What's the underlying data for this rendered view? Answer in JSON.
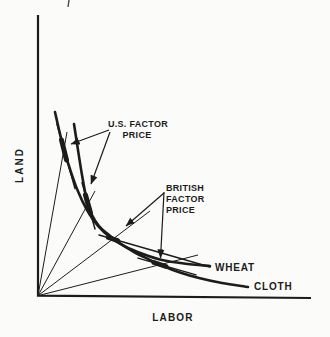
{
  "page": {
    "background": "#fbfbf9",
    "ink": "#1c1c1c"
  },
  "chart_data": {
    "type": "line",
    "title": "",
    "xlabel": "LABOR",
    "ylabel": "LAND",
    "axis_numeric": false,
    "legend": "none",
    "grid": false,
    "axes_geometry": {
      "origin": [
        38,
        295.7
      ],
      "x_end": [
        311,
        298
      ],
      "y_top": [
        38,
        15
      ],
      "stroke_width": 2.2
    },
    "page_artifact_tick": {
      "from": [
        69,
        0
      ],
      "to": [
        68,
        7
      ]
    },
    "curves": [
      {
        "name": "wheat-isoquant",
        "label": "WHEAT",
        "width": 2.6,
        "points": [
          [
            55,
            112
          ],
          [
            61,
            138
          ],
          [
            68,
            163
          ],
          [
            77,
            189
          ],
          [
            87,
            210
          ],
          [
            98,
            226
          ],
          [
            111,
            238
          ],
          [
            126,
            247
          ],
          [
            143,
            254
          ],
          [
            162,
            260
          ],
          [
            184,
            263.5
          ],
          [
            210,
            266
          ]
        ]
      },
      {
        "name": "cloth-isoquant",
        "label": "CLOTH",
        "width": 2.6,
        "points": [
          [
            74,
            124
          ],
          [
            78,
            150
          ],
          [
            82,
            175
          ],
          [
            87,
            201
          ],
          [
            92,
            215
          ],
          [
            99,
            226
          ],
          [
            109,
            235
          ],
          [
            121,
            244
          ],
          [
            134,
            252
          ],
          [
            148,
            259
          ],
          [
            163,
            266
          ],
          [
            180,
            272.5
          ],
          [
            199,
            278
          ],
          [
            222,
            283
          ],
          [
            248,
            287
          ]
        ]
      }
    ],
    "factor_price_lines": [
      {
        "name": "us-wheat-tangent",
        "country": "U.S.",
        "tangent_to": "wheat",
        "from": [
          57,
          124
        ],
        "to": [
          75,
          188.6
        ]
      },
      {
        "name": "us-cloth-tangent",
        "country": "U.S.",
        "tangent_to": "cloth",
        "from": [
          82,
          182.6
        ],
        "to": [
          95,
          229
        ]
      },
      {
        "name": "british-wheat-tangent",
        "country": "British",
        "tangent_to": "wheat",
        "from": [
          99,
          235
        ],
        "to": [
          210,
          267
        ]
      },
      {
        "name": "british-cloth-tangent",
        "country": "British",
        "tangent_to": "cloth",
        "from": [
          138,
          258.1
        ],
        "to": [
          196,
          274.9
        ]
      }
    ],
    "origin_rays": [
      {
        "name": "ray-us-wheat",
        "to": [
          67,
          132
        ]
      },
      {
        "name": "ray-us-cloth",
        "to": [
          95,
          191
        ]
      },
      {
        "name": "ray-british-wheat",
        "to": [
          150,
          211
        ]
      },
      {
        "name": "ray-british-cloth",
        "to": [
          198,
          255
        ]
      }
    ],
    "tangency_dots": [
      {
        "name": "dot-us-wheat",
        "from": [
          61.5,
          140
        ],
        "to": [
          66.5,
          160
        ]
      },
      {
        "name": "dot-us-cloth",
        "from": [
          85.5,
          195
        ],
        "to": [
          90.5,
          213
        ]
      },
      {
        "name": "dot-british-wheat",
        "from": [
          108.5,
          237.5
        ],
        "to": [
          117.5,
          240.5
        ]
      },
      {
        "name": "dot-british-cloth",
        "from": [
          154,
          262.5
        ],
        "to": [
          166,
          266.5
        ]
      }
    ],
    "callout_arrows": [
      {
        "name": "us-arrow-to-wheat-tangency",
        "from": [
          109,
          130
        ],
        "to": [
          71,
          144
        ]
      },
      {
        "name": "us-arrow-to-cloth-tangency",
        "from": [
          110,
          132
        ],
        "to": [
          91,
          184
        ]
      },
      {
        "name": "british-arrow-to-wheat-tangency",
        "from": [
          164,
          193
        ],
        "to": [
          126,
          226
        ]
      },
      {
        "name": "british-arrow-to-cloth-tangency",
        "from": [
          164,
          192
        ],
        "to": [
          160.5,
          258
        ]
      }
    ]
  },
  "labels": {
    "us_factor_price": {
      "anchor": "middle",
      "font_size": 9,
      "lines": [
        {
          "text": "U.S. FACTOR",
          "x": 138,
          "y": 127
        },
        {
          "text": "PRICE",
          "x": 137,
          "y": 137.5
        }
      ]
    },
    "british_factor_price": {
      "anchor": "start",
      "font_size": 9,
      "lines": [
        {
          "text": "BRITISH",
          "x": 166,
          "y": 191
        },
        {
          "text": "FACTOR",
          "x": 166,
          "y": 202
        },
        {
          "text": "PRICE",
          "x": 166,
          "y": 213
        }
      ]
    },
    "wheat": {
      "text": "WHEAT",
      "x": 215,
      "y": 271,
      "font_size": 10
    },
    "cloth": {
      "text": "CLOTH",
      "x": 254,
      "y": 290,
      "font_size": 10
    },
    "x_axis": {
      "text": "LABOR",
      "x": 173,
      "y": 321,
      "font_size": 10
    },
    "y_axis": {
      "text": "LAND",
      "x": 23,
      "y": 165,
      "font_size": 10
    }
  }
}
